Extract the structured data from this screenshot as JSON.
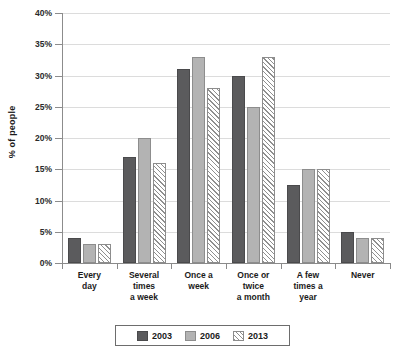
{
  "chart_data": {
    "type": "bar",
    "title": "",
    "subtitle": "",
    "xlabel": "",
    "ylabel": "% of people",
    "ylim": [
      0,
      40
    ],
    "ytick_step": 5,
    "ytick_labels": [
      "0%",
      "5%",
      "10%",
      "15%",
      "20%",
      "25%",
      "30%",
      "35%",
      "40%"
    ],
    "grid": true,
    "legend_position": "bottom",
    "categories": [
      "Every day",
      "Several times a week",
      "Once a week",
      "Once or twice a month",
      "A few times a year",
      "Never"
    ],
    "category_lines": [
      [
        "Every",
        "day"
      ],
      [
        "Several",
        "times",
        "a week"
      ],
      [
        "Once a",
        "week"
      ],
      [
        "Once or",
        "twice",
        "a month"
      ],
      [
        "A few",
        "times a",
        "year"
      ],
      [
        "Never"
      ]
    ],
    "series": [
      {
        "name": "2003",
        "color": "#5b5b5d",
        "pattern": "solid-dark",
        "values": [
          4,
          17,
          31,
          30,
          12.5,
          5
        ]
      },
      {
        "name": "2006",
        "color": "#b3b3b3",
        "pattern": "solid-light",
        "values": [
          3,
          20,
          33,
          25,
          15,
          4
        ]
      },
      {
        "name": "2013",
        "color": "#ffffff",
        "pattern": "diagonal-hatch",
        "values": [
          3,
          16,
          28,
          33,
          15,
          4
        ]
      }
    ]
  },
  "legend": {
    "items": [
      {
        "label": "2003"
      },
      {
        "label": "2006"
      },
      {
        "label": "2013"
      }
    ]
  },
  "axis": {
    "y_title": "% of people"
  },
  "colors": {
    "series_2003": "#5b5b5d",
    "series_2006": "#b3b3b3",
    "series_2013": "#ffffff",
    "gridline": "#dcdcdc",
    "axis": "#8a8a8a",
    "text": "#1b1b1b",
    "background": "#ffffff"
  }
}
